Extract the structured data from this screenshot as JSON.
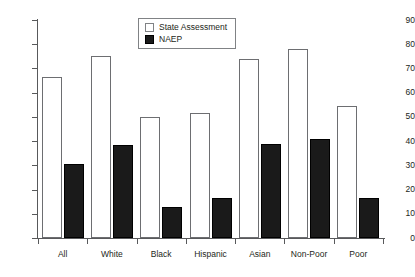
{
  "chart_data": {
    "type": "bar",
    "title": "",
    "subtitle": "",
    "xlabel": "",
    "ylabel": "",
    "ylim": [
      0,
      90
    ],
    "ytick_step": 10,
    "yticks": [
      "0",
      "10",
      "20",
      "30",
      "40",
      "50",
      "60",
      "70",
      "80",
      "90"
    ],
    "grid": false,
    "legend_position": "top-center",
    "categories": [
      "All",
      "White",
      "Black",
      "Hispanic",
      "Asian",
      "Non-Poor",
      "Poor"
    ],
    "series": [
      {
        "name": "State Assessment",
        "color": "#ffffff",
        "border_color": "#6d6e71",
        "values": [
          66.5,
          75,
          50,
          51.5,
          74,
          78,
          54.5
        ]
      },
      {
        "name": "NAEP",
        "color": "#1a1a1a",
        "border_color": "#000000",
        "values": [
          30.5,
          38.5,
          13,
          16.5,
          39,
          41,
          16.5
        ]
      }
    ]
  },
  "legend": {
    "items": [
      {
        "label": "State Assessment",
        "swatch": "state"
      },
      {
        "label": "NAEP",
        "swatch": "naep"
      }
    ]
  },
  "axis": {
    "line_color": "#58595b",
    "label_color": "#231f20"
  }
}
